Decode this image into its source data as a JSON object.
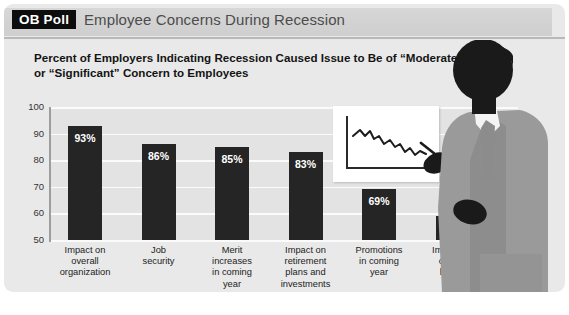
{
  "header": {
    "badge": "OB Poll",
    "title": "Employee Concerns During Recession"
  },
  "subtitle": "Percent of Employers Indicating Recession Caused Issue to Be of “Moderate” or “Significant” Concern to Employees",
  "colors": {
    "panel_bg": "#e9e9e9",
    "plot_bg": "#e3e3e3",
    "bar": "#252525",
    "gridline": "#fbfbfb",
    "axis": "#9d9d9d",
    "badge_bg": "#0d0d0d",
    "header_bg": "#d2d2d2",
    "suit": "#9a9a9a",
    "suit_shadow": "#8a8a8a",
    "head": "#1a1a1a",
    "shirt": "#f2f2f2",
    "tie": "#8c8c8c"
  },
  "icons": {
    "mini_chart": "declining-line-chart-icon",
    "presenter": "businessman-silhouette-icon",
    "pointer": "pointing-hand-icon"
  },
  "chart_data": {
    "type": "bar",
    "title": "Percent of Employers Indicating Recession Caused Issue to Be of “Moderate” or “Significant” Concern to Employees",
    "xlabel": "",
    "ylabel": "",
    "ylim": [
      50,
      100
    ],
    "yticks": [
      50,
      60,
      70,
      80,
      90,
      100
    ],
    "grid": true,
    "legend": "none",
    "categories": [
      "Impact on overall organization",
      "Job security",
      "Merit increases in coming year",
      "Impact on retirement plans and investments",
      "Promotions in coming year",
      "Impact on cost of health care"
    ],
    "category_lines": [
      [
        "Impact on",
        "overall",
        "organization"
      ],
      [
        "Job",
        "security"
      ],
      [
        "Merit",
        "increases",
        "in coming",
        "year"
      ],
      [
        "Impact on",
        "retirement",
        "plans and",
        "investments"
      ],
      [
        "Promotions",
        "in coming",
        "year"
      ],
      [
        "Impact on",
        "cost of",
        "health",
        "care"
      ]
    ],
    "values": [
      93,
      86,
      85,
      83,
      69,
      59
    ],
    "value_labels": [
      "93%",
      "86%",
      "85%",
      "83%",
      "69%",
      "59%"
    ]
  }
}
